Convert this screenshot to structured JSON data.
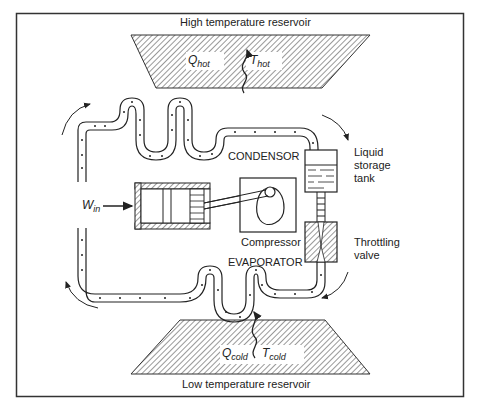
{
  "diagram": {
    "title_top": "High temperature reservoir",
    "title_bottom": "Low temperature reservoir",
    "hot": {
      "q_main": "Q",
      "q_sub": "hot",
      "t_main": "T",
      "t_sub": "hot"
    },
    "cold": {
      "q_main": "Q",
      "q_sub": "cold",
      "t_main": "T",
      "t_sub": "cold"
    },
    "work": {
      "main": "W",
      "sub": "in"
    },
    "components": {
      "condensor": "CONDENSOR",
      "evaporator": "EVAPORATOR",
      "compressor": "Compressor",
      "tank_line1": "Liquid",
      "tank_line2": "storage",
      "tank_line3": "tank",
      "valve_line1": "Throttling",
      "valve_line2": "valve"
    },
    "colors": {
      "ink": "#222222",
      "frame": "#333333",
      "paper": "#ffffff"
    }
  }
}
